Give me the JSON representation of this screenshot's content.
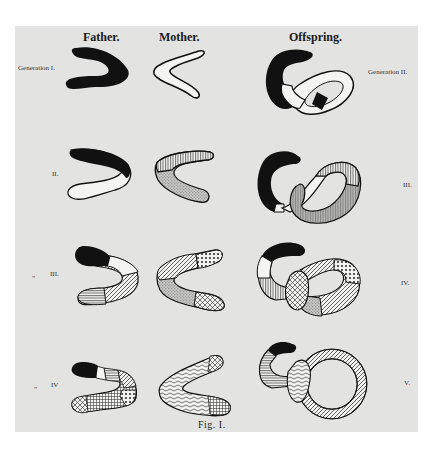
{
  "figure": {
    "caption": "Fig. I.",
    "columns": {
      "father": "Father.",
      "mother": "Mother.",
      "offspring": "Offspring."
    },
    "parent_generation_labels": [
      "Generation I.",
      "II.",
      "III.",
      "IV"
    ],
    "parent_row_marks": [
      "",
      "",
      "„",
      "„"
    ],
    "offspring_generation_labels": [
      "Generation II.",
      "III.",
      "IV.",
      "V."
    ],
    "rows": [
      {
        "father": "solid black V",
        "mother": "white outline V",
        "offspring": "black C-loop with white twisted loop, black band"
      },
      {
        "father": "black top / white bottom V",
        "mother": "vertical-lined / stippled V",
        "offspring": "black C-loop with white and striped loops"
      },
      {
        "father": "black tip, white, hatched segments",
        "mother": "diagonal, dotted, stippled, cross-hatched segments",
        "offspring": "black-tipped loop with mixed patterned figure-eight"
      },
      {
        "father": "black tip with multiple patterned segments",
        "mother": "wavy, stippled, cross-hatched segments",
        "offspring": "black-tipped loop with ring of many patterns"
      }
    ]
  },
  "colors": {
    "plate_background": "#e3e3e1",
    "ink": "#111111",
    "page": "#ffffff"
  }
}
